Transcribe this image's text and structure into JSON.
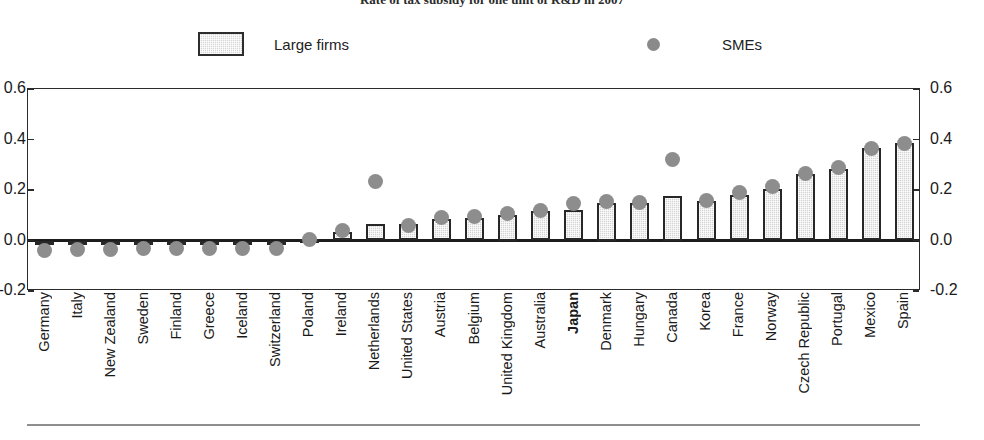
{
  "chart_data": {
    "type": "bar",
    "title": "Rate of tax subsidy for one unit of R&D in 2007",
    "xlabel": "",
    "ylabel": "",
    "ylim": [
      -0.2,
      0.6
    ],
    "yticks": [
      -0.2,
      0.0,
      0.2,
      0.4,
      0.6
    ],
    "ytick_labels": [
      "-0.2",
      "0.0",
      "0.2",
      "0.4",
      "0.6"
    ],
    "ytick_labels_right": [
      "-0.2",
      "0.0",
      "0.2",
      "0.4",
      "0.6"
    ],
    "grid": false,
    "legend_position": "top",
    "highlight_category": "Japan",
    "categories": [
      "Germany",
      "Italy",
      "New Zealand",
      "Sweden",
      "Finland",
      "Greece",
      "Iceland",
      "Switzerland",
      "Poland",
      "Ireland",
      "Netherlands",
      "United States",
      "Austria",
      "Belgium",
      "United Kingdom",
      "Australia",
      "Japan",
      "Denmark",
      "Hungary",
      "Canada",
      "Korea",
      "France",
      "Norway",
      "Czech Republic",
      "Portugal",
      "Mexico",
      "Spain"
    ],
    "series": [
      {
        "name": "Large firms",
        "type": "bar",
        "values": [
          -0.015,
          -0.015,
          -0.015,
          -0.015,
          -0.015,
          -0.015,
          -0.015,
          -0.015,
          0.005,
          0.035,
          0.065,
          0.065,
          0.085,
          0.09,
          0.1,
          0.115,
          0.12,
          0.15,
          0.15,
          0.175,
          0.155,
          0.18,
          0.205,
          0.265,
          0.285,
          0.365,
          0.385
        ]
      },
      {
        "name": "SMEs",
        "type": "scatter",
        "values": [
          -0.04,
          -0.035,
          -0.035,
          -0.03,
          -0.03,
          -0.03,
          -0.03,
          -0.03,
          0.005,
          0.04,
          0.235,
          0.06,
          0.09,
          0.095,
          0.105,
          0.12,
          0.145,
          0.155,
          0.15,
          0.32,
          0.16,
          0.19,
          0.215,
          0.265,
          0.29,
          0.365,
          0.385
        ]
      }
    ]
  },
  "legend": {
    "items": [
      {
        "label": "Large firms",
        "marker": "square-swatch",
        "color": "#d5d5d5"
      },
      {
        "label": "SMEs",
        "marker": "circle-dot",
        "color": "#8a8a8a"
      }
    ]
  },
  "colors": {
    "bar_fill": "#d2d2d2",
    "bar_outline": "#272727",
    "dot": "#8d8d8d",
    "axis": "#2b2b2b",
    "text": "#1a1a1a"
  }
}
